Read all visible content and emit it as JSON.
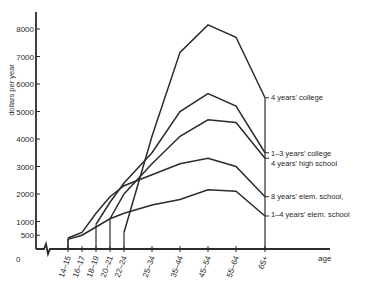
{
  "chart_data": {
    "type": "line",
    "title": "",
    "xlabel": "age",
    "ylabel": "dollars per year",
    "ylim": [
      0,
      8500
    ],
    "y_ticks": [
      500,
      1000,
      2000,
      3000,
      4000,
      5000,
      6000,
      7000,
      8000
    ],
    "y_tick_labels": [
      "500",
      "1000",
      "2000",
      "3000",
      "4000",
      "5000",
      "6000",
      "7000",
      "8000"
    ],
    "origin_label": "0",
    "categories": [
      "14–15",
      "16–17",
      "18–19",
      "20–21",
      "22–24",
      "25–34",
      "35–44",
      "45–54",
      "55–64",
      "65+"
    ],
    "grid": false,
    "legend_position": "inline-right",
    "series": [
      {
        "name": "4 years' college",
        "start_index": 4,
        "values": [
          null,
          null,
          null,
          null,
          600,
          4100,
          7150,
          8150,
          7700,
          5500
        ]
      },
      {
        "name": "1–3 years' college",
        "start_index": 2,
        "values": [
          null,
          null,
          900,
          1700,
          2400,
          3500,
          5000,
          5650,
          5200,
          3500
        ]
      },
      {
        "name": "4 years' high school",
        "start_index": 3,
        "values": [
          null,
          null,
          null,
          1100,
          2000,
          3100,
          4100,
          4700,
          4600,
          3300
        ]
      },
      {
        "name": "8 years' elem. school,",
        "start_index": 0,
        "values": [
          400,
          600,
          1300,
          1900,
          2300,
          2700,
          3100,
          3300,
          3000,
          1900
        ]
      },
      {
        "name": "1–4 years' elem. school",
        "start_index": 0,
        "values": [
          350,
          500,
          800,
          1100,
          1300,
          1600,
          1800,
          2150,
          2100,
          1200
        ]
      }
    ]
  }
}
